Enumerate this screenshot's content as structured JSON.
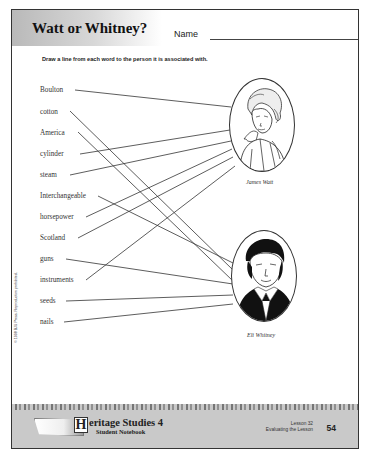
{
  "header": {
    "title": "Watt or Whitney?",
    "name_label": "Name",
    "instructions": "Draw a line from each word to the person it is associated with."
  },
  "words": [
    {
      "label": "Boulton",
      "y": 90,
      "answer": "watt"
    },
    {
      "label": "cotton",
      "y": 112,
      "answer": "whitney"
    },
    {
      "label": "America",
      "y": 133,
      "answer": "whitney"
    },
    {
      "label": "cylinder",
      "y": 154,
      "answer": "watt"
    },
    {
      "label": "steam",
      "y": 175,
      "answer": "watt"
    },
    {
      "label": "Interchangeable",
      "y": 196,
      "answer": "whitney"
    },
    {
      "label": "horsepower",
      "y": 217,
      "answer": "watt"
    },
    {
      "label": "Scotland",
      "y": 238,
      "answer": "watt"
    },
    {
      "label": "guns",
      "y": 259,
      "answer": "whitney"
    },
    {
      "label": "instruments",
      "y": 280,
      "answer": "watt"
    },
    {
      "label": "seeds",
      "y": 301,
      "answer": "whitney"
    },
    {
      "label": "nails",
      "y": 322,
      "answer": "whitney"
    }
  ],
  "portraits": {
    "watt": {
      "caption": "James Watt"
    },
    "whitney": {
      "caption": "Eli Whitney"
    }
  },
  "copyright": "© 1998 BJU Press. Reproduction prohibited.",
  "footer": {
    "brand_initial": "H",
    "brand_title": "eritage Studies 4",
    "brand_subtitle": "Student Notebook",
    "lesson": "Lesson 32",
    "lesson_subtitle": "Evaluating the Lesson",
    "page_number": "54"
  },
  "colors": {
    "ink": "#222222",
    "line": "#333333",
    "footer_bg": "#c9c9c9"
  }
}
